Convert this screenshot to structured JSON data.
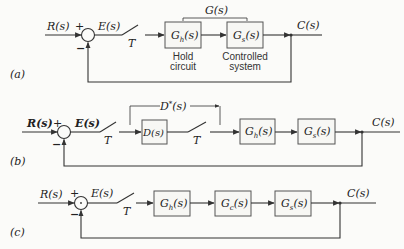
{
  "diagrams": {
    "a": {
      "label": "(a)",
      "input": "R(s)",
      "plus": "+",
      "minus": "−",
      "error": "E(s)",
      "sampler": "T",
      "blocks": [
        {
          "main": "G",
          "sub": "h",
          "arg": "(s)",
          "caption1": "Hold",
          "caption2": "circuit"
        },
        {
          "main": "G",
          "sub": "s",
          "arg": "(s)",
          "caption1": "Controlled",
          "caption2": "system"
        }
      ],
      "bracket_label": "G(s)",
      "output": "C(s)"
    },
    "b": {
      "label": "(b)",
      "input": "R(s)",
      "plus": "+",
      "minus": "−",
      "error": "E(s)",
      "sampler1": "T",
      "sampler2": "T",
      "bracket_label_main": "D",
      "bracket_label_sup": "*",
      "bracket_label_arg": "(s)",
      "blocks": [
        {
          "main": "D(s)"
        },
        {
          "main": "G",
          "sub": "h",
          "arg": "(s)"
        },
        {
          "main": "G",
          "sub": "s",
          "arg": "(s)"
        }
      ],
      "output": "C(s)"
    },
    "c": {
      "label": "(c)",
      "input": "R(s)",
      "plus": "+",
      "minus": "−",
      "error": "E(s)",
      "sampler": "T",
      "blocks": [
        {
          "main": "G",
          "sub": "h",
          "arg": "(s)"
        },
        {
          "main": "G",
          "sub": "c",
          "arg": "(s)"
        },
        {
          "main": "G",
          "sub": "s",
          "arg": "(s)"
        }
      ],
      "output": "C(s)"
    }
  }
}
